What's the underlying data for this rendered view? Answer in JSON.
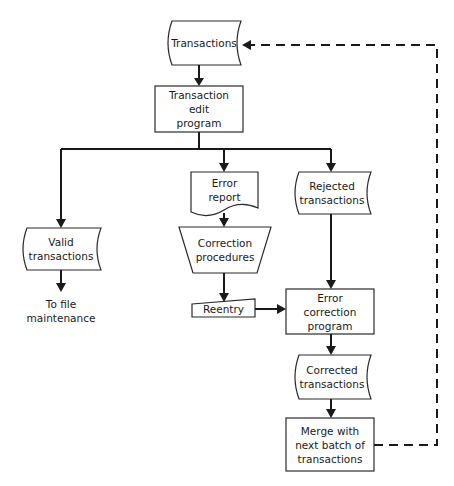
{
  "diagram": {
    "type": "system flowchart",
    "nodes": {
      "transactions": {
        "label": "Transactions",
        "shape": "stored-data"
      },
      "edit_program": {
        "label": "Transaction\nedit\nprogram",
        "shape": "process"
      },
      "valid_transactions": {
        "label": "Valid\ntransactions",
        "shape": "stored-data"
      },
      "to_file_maintenance": {
        "label": "To file\nmaintenance",
        "shape": "text"
      },
      "error_report": {
        "label": "Error\nreport",
        "shape": "document"
      },
      "correction_procedures": {
        "label": "Correction\nprocedures",
        "shape": "manual-operation"
      },
      "reentry": {
        "label": "Reentry",
        "shape": "manual-input"
      },
      "rejected_transactions": {
        "label": "Rejected\ntransactions",
        "shape": "stored-data"
      },
      "error_correction_program": {
        "label": "Error\ncorrection\nprogram",
        "shape": "process"
      },
      "corrected_transactions": {
        "label": "Corrected\ntransactions",
        "shape": "stored-data"
      },
      "merge": {
        "label": "Merge with\nnext batch of\ntransactions",
        "shape": "process"
      }
    },
    "edges": [
      {
        "from": "transactions",
        "to": "edit_program",
        "style": "solid"
      },
      {
        "from": "edit_program",
        "to": "valid_transactions",
        "style": "solid"
      },
      {
        "from": "edit_program",
        "to": "error_report",
        "style": "solid"
      },
      {
        "from": "edit_program",
        "to": "rejected_transactions",
        "style": "solid"
      },
      {
        "from": "valid_transactions",
        "to": "to_file_maintenance",
        "style": "solid"
      },
      {
        "from": "error_report",
        "to": "correction_procedures",
        "style": "solid"
      },
      {
        "from": "correction_procedures",
        "to": "reentry",
        "style": "solid"
      },
      {
        "from": "reentry",
        "to": "error_correction_program",
        "style": "solid"
      },
      {
        "from": "rejected_transactions",
        "to": "error_correction_program",
        "style": "solid"
      },
      {
        "from": "error_correction_program",
        "to": "corrected_transactions",
        "style": "solid"
      },
      {
        "from": "corrected_transactions",
        "to": "merge",
        "style": "solid"
      },
      {
        "from": "merge",
        "to": "transactions",
        "style": "dashed"
      }
    ]
  }
}
